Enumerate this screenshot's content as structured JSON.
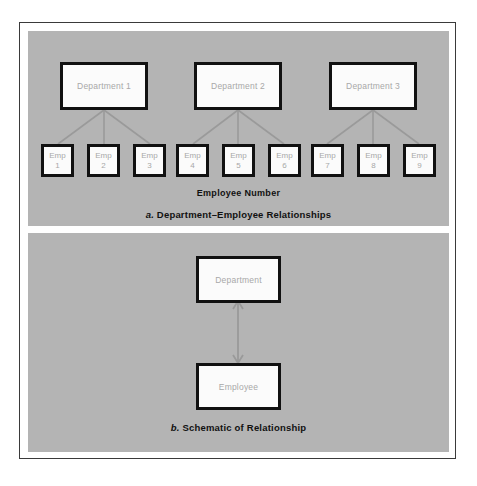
{
  "figure": {
    "background_color": "#ffffff",
    "frame_border_color": "#3a3a3a",
    "panel_background_color": "#b4b4b4",
    "box_fill_color": "#fbfbfb",
    "box_border_color": "#111111",
    "box_label_color": "#a8a8a8",
    "caption_color": "#111111"
  },
  "panel_a": {
    "caption_index": "a.",
    "caption_text": "Department–Employee Relationships",
    "axis_label": "Employee  Number",
    "departments": [
      {
        "label": "Department 1"
      },
      {
        "label": "Department 2"
      },
      {
        "label": "Department 3"
      }
    ],
    "employees": [
      {
        "line1": "Emp",
        "line2": "1"
      },
      {
        "line1": "Emp",
        "line2": "2"
      },
      {
        "line1": "Emp",
        "line2": "3"
      },
      {
        "line1": "Emp",
        "line2": "4"
      },
      {
        "line1": "Emp",
        "line2": "5"
      },
      {
        "line1": "Emp",
        "line2": "6"
      },
      {
        "line1": "Emp",
        "line2": "7"
      },
      {
        "line1": "Emp",
        "line2": "8"
      },
      {
        "line1": "Emp",
        "line2": "9"
      }
    ],
    "relationships": [
      {
        "from": "Department 1",
        "to": [
          "Emp 1",
          "Emp 2",
          "Emp 3"
        ]
      },
      {
        "from": "Department 2",
        "to": [
          "Emp 4",
          "Emp 5",
          "Emp 6"
        ]
      },
      {
        "from": "Department 3",
        "to": [
          "Emp 7",
          "Emp 8",
          "Emp 9"
        ]
      }
    ]
  },
  "panel_b": {
    "caption_index": "b.",
    "caption_text": "Schematic of Relationship",
    "top_node": {
      "label": "Department"
    },
    "bottom_node": {
      "label": "Employee"
    },
    "connector": {
      "type": "double-headed-arrow",
      "orientation": "vertical"
    }
  }
}
